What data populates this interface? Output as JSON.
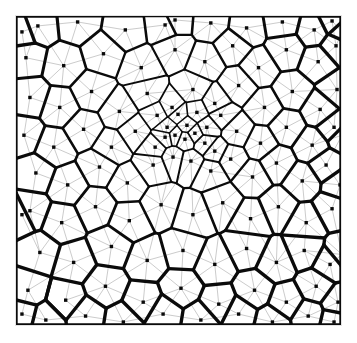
{
  "figure": {
    "title": "",
    "kind": "voronoi-delaunay-diagram",
    "frame": {
      "x": 15,
      "y": 15,
      "width": 327,
      "height": 311,
      "border_color": "#e3e3e3"
    },
    "background_color": "#ffffff"
  },
  "chart_data": {
    "type": "scatter",
    "title": "",
    "xlabel": "",
    "ylabel": "",
    "xlim": [
      0,
      327
    ],
    "ylim": [
      0,
      311
    ],
    "grid": false,
    "legend": "none",
    "annotations": [
      "Point density increases toward the centre of the domain",
      "Thick black polygons are Voronoi cell boundaries",
      "Thin grey segments are Delaunay triangulation edges",
      "Small filled black squares mark the generating sites"
    ],
    "styles": {
      "voronoi_edge_color": "#0b0b0b",
      "voronoi_edge_width_min": 1.4,
      "voronoi_edge_width_max": 3.4,
      "delaunay_edge_color": "#8a8a8a",
      "delaunay_edge_width": 0.45,
      "site_marker_color": "#0a0a0a",
      "site_marker_size": 3.4
    },
    "center_of_refinement": [
      160,
      105
    ],
    "site_count": 116,
    "sites": [
      [
        22,
        10
      ],
      [
        62,
        6
      ],
      [
        110,
        14
      ],
      [
        150,
        9
      ],
      [
        196,
        7
      ],
      [
        232,
        12
      ],
      [
        268,
        6
      ],
      [
        300,
        14
      ],
      [
        318,
        5
      ],
      [
        10,
        42
      ],
      [
        48,
        50
      ],
      [
        88,
        38
      ],
      [
        126,
        52
      ],
      [
        160,
        34
      ],
      [
        190,
        46
      ],
      [
        218,
        30
      ],
      [
        244,
        52
      ],
      [
        272,
        34
      ],
      [
        304,
        46
      ],
      [
        322,
        30
      ],
      [
        14,
        82
      ],
      [
        44,
        92
      ],
      [
        76,
        76
      ],
      [
        104,
        96
      ],
      [
        132,
        78
      ],
      [
        157,
        92
      ],
      [
        178,
        74
      ],
      [
        200,
        88
      ],
      [
        224,
        70
      ],
      [
        250,
        92
      ],
      [
        278,
        76
      ],
      [
        306,
        94
      ],
      [
        323,
        74
      ],
      [
        8,
        120
      ],
      [
        38,
        132
      ],
      [
        68,
        114
      ],
      [
        96,
        132
      ],
      [
        120,
        116
      ],
      [
        142,
        100
      ],
      [
        152,
        112
      ],
      [
        163,
        99
      ],
      [
        172,
        110
      ],
      [
        182,
        97
      ],
      [
        192,
        112
      ],
      [
        206,
        100
      ],
      [
        222,
        116
      ],
      [
        246,
        128
      ],
      [
        272,
        112
      ],
      [
        298,
        130
      ],
      [
        320,
        112
      ],
      [
        150,
        122
      ],
      [
        160,
        120
      ],
      [
        170,
        124
      ],
      [
        180,
        118
      ],
      [
        190,
        128
      ],
      [
        140,
        132
      ],
      [
        200,
        136
      ],
      [
        20,
        158
      ],
      [
        52,
        170
      ],
      [
        84,
        152
      ],
      [
        112,
        168
      ],
      [
        138,
        150
      ],
      [
        158,
        142
      ],
      [
        176,
        146
      ],
      [
        196,
        156
      ],
      [
        216,
        144
      ],
      [
        238,
        162
      ],
      [
        262,
        148
      ],
      [
        288,
        166
      ],
      [
        312,
        150
      ],
      [
        326,
        170
      ],
      [
        14,
        196
      ],
      [
        46,
        208
      ],
      [
        80,
        192
      ],
      [
        114,
        206
      ],
      [
        146,
        190
      ],
      [
        178,
        200
      ],
      [
        208,
        188
      ],
      [
        236,
        204
      ],
      [
        264,
        192
      ],
      [
        292,
        208
      ],
      [
        318,
        194
      ],
      [
        24,
        238
      ],
      [
        58,
        248
      ],
      [
        96,
        232
      ],
      [
        132,
        246
      ],
      [
        168,
        236
      ],
      [
        200,
        250
      ],
      [
        232,
        234
      ],
      [
        262,
        248
      ],
      [
        290,
        236
      ],
      [
        316,
        250
      ],
      [
        12,
        276
      ],
      [
        50,
        286
      ],
      [
        90,
        272
      ],
      [
        128,
        288
      ],
      [
        166,
        274
      ],
      [
        204,
        290
      ],
      [
        240,
        276
      ],
      [
        272,
        288
      ],
      [
        302,
        272
      ],
      [
        324,
        288
      ],
      [
        30,
        306
      ],
      [
        70,
        302
      ],
      [
        108,
        308
      ],
      [
        148,
        300
      ],
      [
        186,
        306
      ],
      [
        224,
        300
      ],
      [
        258,
        308
      ],
      [
        294,
        302
      ],
      [
        320,
        308
      ],
      [
        6,
        16
      ],
      [
        6,
        200
      ],
      [
        6,
        300
      ],
      [
        328,
        16
      ],
      [
        328,
        120
      ],
      [
        328,
        240
      ],
      [
        160,
        4
      ]
    ]
  }
}
